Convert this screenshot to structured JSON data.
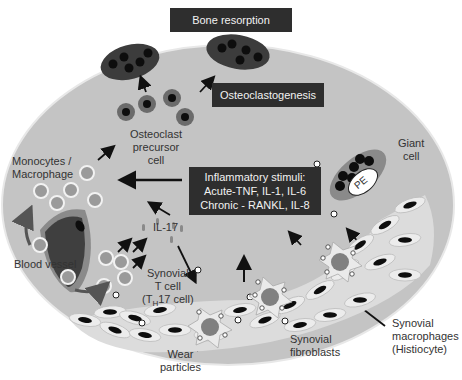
{
  "title_box": "Bone resorption",
  "process_box": "Osteoclastogenesis",
  "stimuli_box": {
    "line1": "Inflammatory stimuli:",
    "line2": "Acute-TNF, IL-1, IL-6",
    "line3": "Chronic - RANKL, IL-8"
  },
  "labels": {
    "osteoclast_precursor": [
      "Osteoclast",
      "precursor",
      "cell"
    ],
    "monocytes": [
      "Monocytes /",
      "Macrophage"
    ],
    "blood_vessel": "Blood vessel",
    "il17": "IL-17",
    "tcell": [
      "Synovial",
      "T cell"
    ],
    "th17_pre": "(T",
    "th17_sub": "H",
    "th17_post": "17 cell)",
    "giant_cell": [
      "Giant",
      "cell"
    ],
    "pe": "PE",
    "synovial_macrophages": [
      "Synovial",
      "macrophages",
      "(Histiocyte)"
    ],
    "synovial_fibroblasts": [
      "Synovial",
      "fibroblasts"
    ],
    "wear_particles": [
      "Wear",
      "particles"
    ]
  },
  "colors": {
    "background_gray": "#c4c4c4",
    "box_dark": "#2e2e2e",
    "cell_dark": "#3c3c3c",
    "nucleus": "#111111",
    "precursor": "#6b6b6b",
    "fibroblast_fill": "#e4e4e4"
  }
}
